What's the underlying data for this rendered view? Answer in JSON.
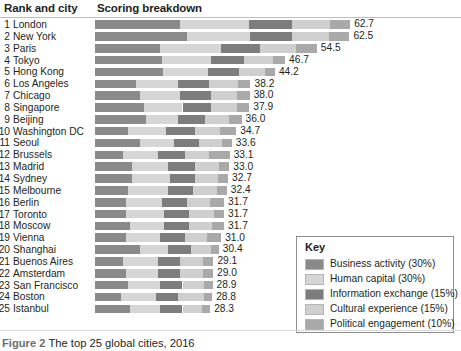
{
  "headers": {
    "rank_and_city": "Rank and city",
    "scoring_breakdown": "Scoring breakdown"
  },
  "caption": {
    "figure_label": "Figure 2",
    "text": "The top 25 global cities, 2016"
  },
  "key": {
    "title": "Key",
    "items": [
      {
        "label": "Business activity (30%)",
        "color": "#8a8a8a"
      },
      {
        "label": "Human capital (30%)",
        "color": "#d6d6d6"
      },
      {
        "label": "Information exchange (15%)",
        "color": "#7d7d7d"
      },
      {
        "label": "Cultural experience (15%)",
        "color": "#cfcfcf"
      },
      {
        "label": "Political engagement (10%)",
        "color": "#a9a9a9"
      }
    ]
  },
  "chart_data": {
    "type": "bar",
    "orientation": "horizontal",
    "stacked": true,
    "title": "The top 25 global cities, 2016",
    "xlabel": "",
    "ylabel": "",
    "grid": false,
    "legend_position": "bottom-right",
    "xlim": [
      0,
      70
    ],
    "series": [
      {
        "name": "Business activity (30%)",
        "color": "#8a8a8a"
      },
      {
        "name": "Human capital (30%)",
        "color": "#d6d6d6"
      },
      {
        "name": "Information exchange (15%)",
        "color": "#7d7d7d"
      },
      {
        "name": "Cultural experience (15%)",
        "color": "#cfcfcf"
      },
      {
        "name": "Political engagement (10%)",
        "color": "#a9a9a9"
      }
    ],
    "categories": [
      "London",
      "New York",
      "Paris",
      "Tokyo",
      "Hong Kong",
      "Los Angeles",
      "Chicago",
      "Singapore",
      "Beijing",
      "Washington DC",
      "Seoul",
      "Brussels",
      "Madrid",
      "Sydney",
      "Melbourne",
      "Berlin",
      "Toronto",
      "Moscow",
      "Vienna",
      "Shanghai",
      "Buenos Aires",
      "Amsterdam",
      "San Francisco",
      "Boston",
      "Istanbul"
    ],
    "rows": [
      {
        "rank": "1",
        "city": "London",
        "total": "62.7",
        "segments": [
          21.0,
          16.8,
          10.5,
          9.4,
          5.0
        ]
      },
      {
        "rank": "2",
        "city": "New York",
        "total": "62.5",
        "segments": [
          22.5,
          15.5,
          10.5,
          9.0,
          5.0
        ]
      },
      {
        "rank": "3",
        "city": "Paris",
        "total": "54.5",
        "segments": [
          16.0,
          15.0,
          9.5,
          9.0,
          5.0
        ]
      },
      {
        "rank": "4",
        "city": "Tokyo",
        "total": "46.7",
        "segments": [
          16.5,
          12.0,
          8.0,
          7.2,
          3.0
        ]
      },
      {
        "rank": "5",
        "city": "Hong Kong",
        "total": "44.2",
        "segments": [
          16.8,
          11.0,
          7.5,
          6.4,
          2.5
        ]
      },
      {
        "rank": "6",
        "city": "Los Angeles",
        "total": "38.2",
        "segments": [
          10.0,
          10.5,
          7.5,
          7.2,
          3.0
        ]
      },
      {
        "rank": "7",
        "city": "Chicago",
        "total": "38.0",
        "segments": [
          11.0,
          10.0,
          7.5,
          6.5,
          3.0
        ]
      },
      {
        "rank": "8",
        "city": "Singapore",
        "total": "37.9",
        "segments": [
          12.0,
          9.5,
          7.0,
          6.4,
          3.0
        ]
      },
      {
        "rank": "9",
        "city": "Beijing",
        "total": "36.0",
        "segments": [
          12.5,
          8.0,
          6.5,
          6.0,
          3.0
        ]
      },
      {
        "rank": "10",
        "city": "Washington DC",
        "total": "34.7",
        "segments": [
          8.0,
          9.5,
          7.0,
          6.2,
          4.0
        ]
      },
      {
        "rank": "11",
        "city": "Seoul",
        "total": "33.6",
        "segments": [
          11.0,
          8.5,
          6.0,
          5.6,
          2.5
        ]
      },
      {
        "rank": "12",
        "city": "Brussels",
        "total": "33.1",
        "segments": [
          7.0,
          8.5,
          6.5,
          6.1,
          5.0
        ]
      },
      {
        "rank": "13",
        "city": "Madrid",
        "total": "33.0",
        "segments": [
          9.0,
          9.0,
          6.5,
          6.0,
          2.5
        ]
      },
      {
        "rank": "14",
        "city": "Sydney",
        "total": "32.7",
        "segments": [
          9.0,
          9.5,
          6.0,
          5.7,
          2.5
        ]
      },
      {
        "rank": "15",
        "city": "Melbourne",
        "total": "32.4",
        "segments": [
          8.0,
          10.0,
          6.0,
          5.9,
          2.5
        ]
      },
      {
        "rank": "16",
        "city": "Berlin",
        "total": "31.7",
        "segments": [
          7.5,
          9.0,
          6.0,
          5.7,
          3.5
        ]
      },
      {
        "rank": "17",
        "city": "Toronto",
        "total": "31.7",
        "segments": [
          7.5,
          9.5,
          6.0,
          6.2,
          2.5
        ]
      },
      {
        "rank": "18",
        "city": "Moscow",
        "total": "31.7",
        "segments": [
          8.5,
          8.5,
          6.0,
          5.7,
          3.0
        ]
      },
      {
        "rank": "19",
        "city": "Vienna",
        "total": "31.0",
        "segments": [
          7.5,
          8.5,
          6.0,
          5.5,
          3.5
        ]
      },
      {
        "rank": "20",
        "city": "Shanghai",
        "total": "30.4",
        "segments": [
          11.0,
          7.0,
          5.5,
          4.9,
          2.0
        ]
      },
      {
        "rank": "21",
        "city": "Buenos Aires",
        "total": "29.1",
        "segments": [
          7.0,
          8.5,
          5.5,
          5.6,
          2.5
        ]
      },
      {
        "rank": "22",
        "city": "Amsterdam",
        "total": "29.0",
        "segments": [
          7.5,
          8.0,
          5.5,
          5.5,
          2.5
        ]
      },
      {
        "rank": "23",
        "city": "San Francisco",
        "total": "28.9",
        "segments": [
          8.0,
          8.0,
          5.5,
          5.4,
          2.0
        ]
      },
      {
        "rank": "24",
        "city": "Boston",
        "total": "28.8",
        "segments": [
          6.5,
          8.5,
          5.5,
          6.3,
          2.0
        ]
      },
      {
        "rank": "25",
        "city": "Istanbul",
        "total": "28.3",
        "segments": [
          8.5,
          7.5,
          5.5,
          4.8,
          2.0
        ]
      }
    ]
  }
}
